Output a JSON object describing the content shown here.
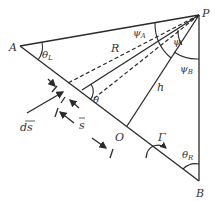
{
  "figure": {
    "points": {
      "A": "A",
      "P": "P",
      "B": "B",
      "O": "O"
    },
    "labels": {
      "theta_L": "θ",
      "theta_L_sub": "L",
      "theta_R": "θ",
      "theta_R_sub": "R",
      "theta": "θ",
      "psi_A": "ψ",
      "psi_A_sub": "A",
      "psi_B": "ψ",
      "psi_B_sub": "B",
      "psi": "ψ",
      "R": "R",
      "h": "h",
      "Gamma": "Γ",
      "ds": "ds",
      "s": "s"
    },
    "colors": {
      "line": "#2a2a2a",
      "text": "#333333",
      "background": "#ffffff"
    }
  }
}
